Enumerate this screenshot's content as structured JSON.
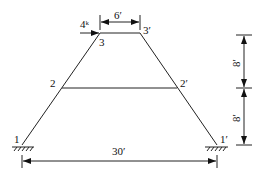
{
  "diagram": {
    "type": "truss",
    "nodes": [
      {
        "id": "1",
        "label": "1",
        "x": 22,
        "y": 145
      },
      {
        "id": "1p",
        "label": "1′",
        "x": 217,
        "y": 145
      },
      {
        "id": "2",
        "label": "2",
        "x": 62,
        "y": 88
      },
      {
        "id": "2p",
        "label": "2′",
        "x": 177,
        "y": 88
      },
      {
        "id": "3",
        "label": "3",
        "x": 100,
        "y": 33
      },
      {
        "id": "3p",
        "label": "3′",
        "x": 140,
        "y": 33
      }
    ],
    "members": [
      [
        "1",
        "2"
      ],
      [
        "2",
        "3"
      ],
      [
        "3",
        "3p"
      ],
      [
        "3p",
        "2p"
      ],
      [
        "2p",
        "1p"
      ],
      [
        "2",
        "2p"
      ]
    ],
    "supports": [
      "1",
      "1p"
    ],
    "load": {
      "label": "4ᵏ",
      "node": "3",
      "direction": "right"
    },
    "dimensions": {
      "top_width": "6′",
      "base_width": "30′",
      "upper_height": "8′",
      "lower_height": "8′"
    }
  }
}
